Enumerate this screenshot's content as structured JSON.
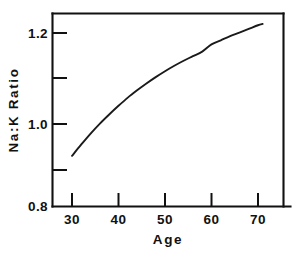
{
  "figure": {
    "background_color": "#ffffff",
    "ink_color": "#111111"
  },
  "chart_data": {
    "type": "line",
    "title": "",
    "subtitle": "",
    "xlabel": "Age",
    "ylabel": "Na:K Ratio",
    "xlim": [
      27,
      74
    ],
    "ylim": [
      0.8,
      1.235
    ],
    "grid": false,
    "legend": null,
    "legend_position": "none",
    "x_ticks": [
      30,
      40,
      50,
      60,
      70
    ],
    "x_tick_labels": [
      "30",
      "40",
      "50",
      "60",
      "70"
    ],
    "y_ticks": [
      0.8,
      1.0,
      1.2
    ],
    "y_tick_labels": [
      "0.8",
      "1.0",
      "1.2"
    ],
    "y_minor_ticks": [
      0.9,
      1.1
    ],
    "series": [
      {
        "name": "Na:K Ratio",
        "color": "#1a1a1a",
        "x": [
          30,
          32,
          34,
          36,
          38,
          40,
          42,
          44,
          46,
          48,
          50,
          52,
          54,
          56,
          58,
          60,
          62,
          64,
          66,
          68,
          70,
          71
        ],
        "values": [
          0.93,
          0.955,
          0.979,
          1.001,
          1.021,
          1.04,
          1.058,
          1.074,
          1.089,
          1.103,
          1.116,
          1.128,
          1.139,
          1.149,
          1.159,
          1.175,
          1.184,
          1.193,
          1.201,
          1.209,
          1.217,
          1.22
        ]
      }
    ],
    "annotations": []
  },
  "axes": {
    "x_axis_title": "Age",
    "y_axis_title": "Na:K Ratio"
  }
}
